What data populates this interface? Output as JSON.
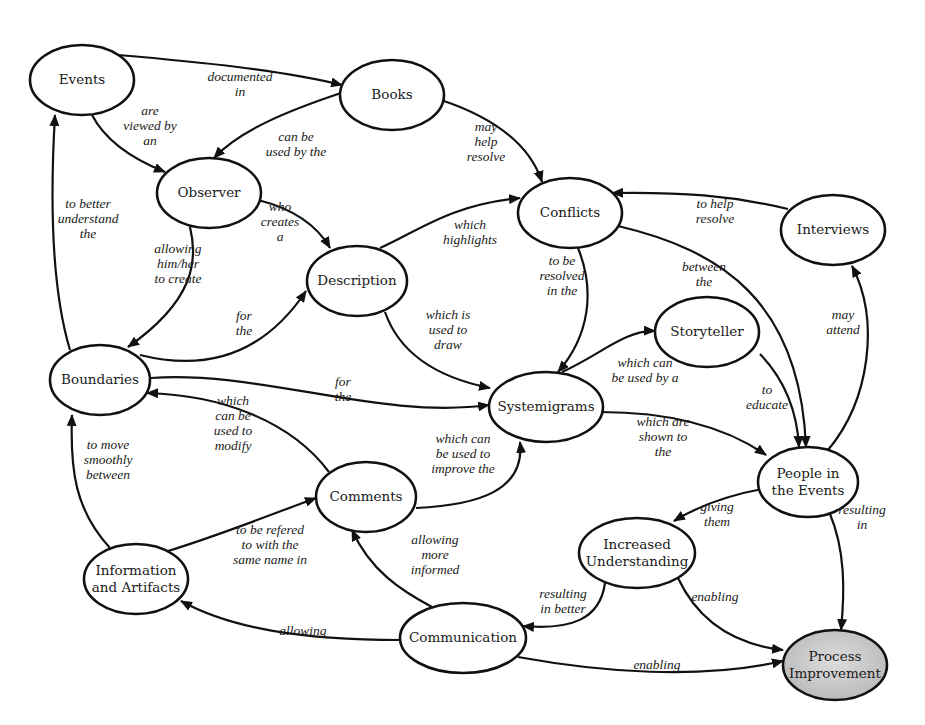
{
  "diagram": {
    "type": "systemigram",
    "highlight_color": "#c8c8c8",
    "nodes": [
      {
        "id": "events",
        "label": [
          "Events"
        ],
        "cx": 82,
        "cy": 80,
        "rx": 52,
        "ry": 35
      },
      {
        "id": "books",
        "label": [
          "Books"
        ],
        "cx": 392,
        "cy": 95,
        "rx": 52,
        "ry": 35
      },
      {
        "id": "observer",
        "label": [
          "Observer"
        ],
        "cx": 209,
        "cy": 193,
        "rx": 52,
        "ry": 35
      },
      {
        "id": "conflicts",
        "label": [
          "Conflicts"
        ],
        "cx": 570,
        "cy": 213,
        "rx": 52,
        "ry": 35
      },
      {
        "id": "interviews",
        "label": [
          "Interviews"
        ],
        "cx": 833,
        "cy": 230,
        "rx": 52,
        "ry": 35
      },
      {
        "id": "description",
        "label": [
          "Description"
        ],
        "cx": 357,
        "cy": 281,
        "rx": 50,
        "ry": 35
      },
      {
        "id": "storyteller",
        "label": [
          "Storyteller"
        ],
        "cx": 707,
        "cy": 332,
        "rx": 52,
        "ry": 35
      },
      {
        "id": "boundaries",
        "label": [
          "Boundaries"
        ],
        "cx": 100,
        "cy": 380,
        "rx": 50,
        "ry": 35
      },
      {
        "id": "systemigrams",
        "label": [
          "Systemigrams"
        ],
        "cx": 546,
        "cy": 407,
        "rx": 57,
        "ry": 35
      },
      {
        "id": "people",
        "label": [
          "People in",
          "the Events"
        ],
        "cx": 808,
        "cy": 482,
        "rx": 50,
        "ry": 35
      },
      {
        "id": "comments",
        "label": [
          "Comments"
        ],
        "cx": 366,
        "cy": 497,
        "rx": 50,
        "ry": 35
      },
      {
        "id": "understanding",
        "label": [
          "Increased",
          "Understanding"
        ],
        "cx": 637,
        "cy": 553,
        "rx": 58,
        "ry": 35
      },
      {
        "id": "info",
        "label": [
          "Information",
          "and Artifacts"
        ],
        "cx": 136,
        "cy": 579,
        "rx": 52,
        "ry": 35
      },
      {
        "id": "communication",
        "label": [
          "Communication"
        ],
        "cx": 463,
        "cy": 638,
        "rx": 63,
        "ry": 35
      },
      {
        "id": "process",
        "label": [
          "Process",
          "Improvement"
        ],
        "cx": 835,
        "cy": 665,
        "rx": 52,
        "ry": 35,
        "highlight": true
      }
    ],
    "edges": [
      {
        "from": "events",
        "to": "books",
        "label": [
          "documented",
          "in"
        ],
        "path": "M118,55 C200,62 280,70 342,85",
        "lx": 240,
        "ly": 84
      },
      {
        "from": "events",
        "to": "observer",
        "label": [
          "are",
          "viewed by",
          "an"
        ],
        "path": "M92,115 C105,140 130,158 165,172",
        "lx": 150,
        "ly": 126
      },
      {
        "from": "books",
        "to": "observer",
        "label": [
          "can be",
          "used by the"
        ],
        "path": "M341,93 C290,110 240,130 214,158",
        "lx": 296,
        "ly": 144
      },
      {
        "from": "books",
        "to": "conflicts",
        "label": [
          "may",
          "help",
          "resolve"
        ],
        "path": "M441,100 C495,118 530,145 542,182",
        "lx": 486,
        "ly": 142
      },
      {
        "from": "observer",
        "to": "description",
        "label": [
          "who",
          "creates",
          "a"
        ],
        "path": "M258,200 C290,208 315,222 330,248",
        "lx": 280,
        "ly": 222
      },
      {
        "from": "observer",
        "to": "boundaries",
        "label": [
          "allowing",
          "him/her",
          "to create"
        ],
        "path": "M190,227 C198,260 195,300 128,347",
        "lx": 178,
        "ly": 264
      },
      {
        "from": "description",
        "to": "conflicts",
        "label": [
          "which",
          "highlights"
        ],
        "path": "M380,248 C420,230 450,205 520,198",
        "lx": 470,
        "ly": 232
      },
      {
        "from": "interviews",
        "to": "conflicts",
        "label": [
          "to help",
          "resolve"
        ],
        "path": "M788,209 C730,195 680,192 612,193",
        "lx": 715,
        "ly": 211
      },
      {
        "from": "conflicts",
        "to": "systemigrams",
        "label": [
          "to be",
          "resolved",
          "in the"
        ],
        "path": "M578,248 C595,290 590,335 558,372",
        "lx": 562,
        "ly": 276
      },
      {
        "from": "conflicts",
        "to": "people",
        "label": [
          "between",
          "the"
        ],
        "path": "M618,226 C720,250 800,300 806,447",
        "lx": 704,
        "ly": 274
      },
      {
        "from": "boundaries",
        "to": "events",
        "label": [
          "to better",
          "understand",
          "the"
        ],
        "path": "M70,350 C52,290 50,200 55,115",
        "lx": 88,
        "ly": 219
      },
      {
        "from": "boundaries",
        "to": "description",
        "label": [
          "for",
          "the"
        ],
        "path": "M140,355 C200,370 260,360 306,291",
        "lx": 244,
        "ly": 323
      },
      {
        "from": "description",
        "to": "systemigrams",
        "label": [
          "which is",
          "used to",
          "draw"
        ],
        "path": "M385,312 C400,355 440,378 490,388",
        "lx": 448,
        "ly": 330
      },
      {
        "from": "boundaries",
        "to": "systemigrams",
        "label": [
          "for",
          "the"
        ],
        "path": "M151,378 C260,370 380,420 489,405",
        "lx": 343,
        "ly": 389
      },
      {
        "from": "systemigrams",
        "to": "storyteller",
        "label": [
          "which can",
          "be used by a"
        ],
        "path": "M562,372 C600,355 625,330 655,331",
        "lx": 645,
        "ly": 370
      },
      {
        "from": "storyteller",
        "to": "people",
        "label": [
          "to",
          "educate"
        ],
        "path": "M760,354 C785,380 797,410 799,447",
        "lx": 767,
        "ly": 397
      },
      {
        "from": "people",
        "to": "interviews",
        "label": [
          "may",
          "attend"
        ],
        "path": "M828,450 C870,400 880,320 852,266",
        "lx": 843,
        "ly": 322
      },
      {
        "from": "systemigrams",
        "to": "people",
        "label": [
          "which are",
          "shown to",
          "the"
        ],
        "path": "M600,412 C680,412 730,430 766,455",
        "lx": 663,
        "ly": 437
      },
      {
        "from": "comments",
        "to": "boundaries",
        "label": [
          "which",
          "can be",
          "used to",
          "modify"
        ],
        "path": "M329,472 C290,420 220,395 147,393",
        "lx": 233,
        "ly": 423
      },
      {
        "from": "comments",
        "to": "systemigrams",
        "label": [
          "which can",
          "be used to",
          "improve the"
        ],
        "path": "M416,508 C480,505 525,490 520,442",
        "lx": 463,
        "ly": 454
      },
      {
        "from": "info",
        "to": "boundaries",
        "label": [
          "to move",
          "smoothly",
          "between"
        ],
        "path": "M110,548 C75,510 70,470 72,415",
        "lx": 108,
        "ly": 460
      },
      {
        "from": "info",
        "to": "comments",
        "label": [
          "to be refered",
          "to with the",
          "same name in"
        ],
        "path": "M168,551 C220,535 270,515 316,498",
        "lx": 270,
        "ly": 545
      },
      {
        "from": "people",
        "to": "understanding",
        "label": [
          "giving",
          "them"
        ],
        "path": "M762,489 C730,495 700,505 674,521",
        "lx": 717,
        "ly": 514
      },
      {
        "from": "people",
        "to": "process",
        "label": [
          "resulting",
          "in"
        ],
        "path": "M830,514 C845,550 845,590 841,630",
        "lx": 862,
        "ly": 517
      },
      {
        "from": "communication",
        "to": "comments",
        "label": [
          "allowing",
          "more",
          "informed"
        ],
        "path": "M432,607 C400,590 370,570 352,530",
        "lx": 435,
        "ly": 555
      },
      {
        "from": "communication",
        "to": "info",
        "label": [
          "allowing"
        ],
        "path": "M400,640 C300,640 230,628 181,601",
        "lx": 303,
        "ly": 631
      },
      {
        "from": "understanding",
        "to": "communication",
        "label": [
          "resulting",
          "in better"
        ],
        "path": "M605,583 C600,620 570,630 523,626",
        "lx": 563,
        "ly": 601
      },
      {
        "from": "understanding",
        "to": "process",
        "label": [
          "enabling"
        ],
        "path": "M678,578 C700,625 740,645 783,650",
        "lx": 715,
        "ly": 597
      },
      {
        "from": "communication",
        "to": "process",
        "label": [
          "enabling"
        ],
        "path": "M518,657 C600,672 700,680 783,661",
        "lx": 657,
        "ly": 665
      }
    ]
  }
}
